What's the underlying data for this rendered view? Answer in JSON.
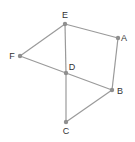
{
  "diagram": {
    "type": "graph",
    "colors": {
      "edge": "#9a9a9a",
      "node": "#8f8f8f",
      "label": "#333333",
      "background": "#ffffff"
    },
    "nodes": [
      {
        "id": "E",
        "label": "E",
        "x": 65,
        "y": 24,
        "lx": 65,
        "ly": 18,
        "anchor": "middle"
      },
      {
        "id": "A",
        "label": "A",
        "x": 118,
        "y": 38,
        "lx": 124,
        "ly": 41,
        "anchor": "middle"
      },
      {
        "id": "F",
        "label": "F",
        "x": 20,
        "y": 56,
        "lx": 12,
        "ly": 59,
        "anchor": "middle"
      },
      {
        "id": "D",
        "label": "D",
        "x": 66,
        "y": 73,
        "lx": 72,
        "ly": 70,
        "anchor": "middle"
      },
      {
        "id": "B",
        "label": "B",
        "x": 112,
        "y": 90,
        "lx": 120,
        "ly": 94,
        "anchor": "middle"
      },
      {
        "id": "C",
        "label": "C",
        "x": 66,
        "y": 122,
        "lx": 66,
        "ly": 134,
        "anchor": "middle"
      }
    ],
    "edges": [
      [
        "E",
        "A"
      ],
      [
        "A",
        "B"
      ],
      [
        "E",
        "F"
      ],
      [
        "F",
        "D"
      ],
      [
        "D",
        "B"
      ],
      [
        "E",
        "D"
      ],
      [
        "D",
        "C"
      ],
      [
        "B",
        "C"
      ]
    ]
  }
}
